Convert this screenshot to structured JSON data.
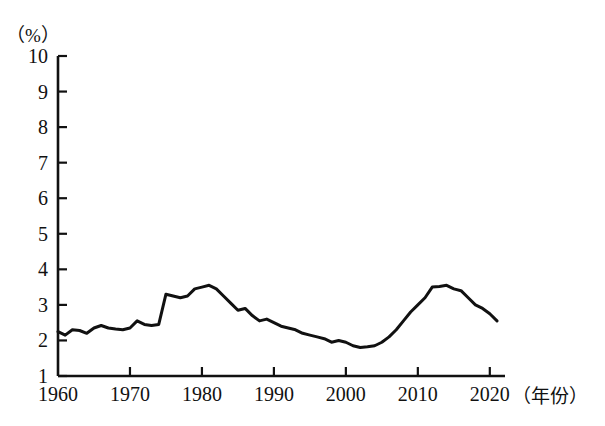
{
  "chart_data": {
    "type": "line",
    "title": "",
    "xlabel": "（年份）",
    "ylabel": "（%）",
    "xlim": [
      1960,
      2021
    ],
    "ylim": [
      1,
      10
    ],
    "grid": false,
    "legend": null,
    "y_ticks": [
      "10",
      "9",
      "8",
      "7",
      "6",
      "5",
      "4",
      "3",
      "2",
      "1"
    ],
    "y_tick_values": [
      10,
      9,
      8,
      7,
      6,
      5,
      4,
      3,
      2,
      1
    ],
    "x_ticks": [
      "1960",
      "1970",
      "1980",
      "1990",
      "2000",
      "2010",
      "2020"
    ],
    "x_tick_values": [
      1960,
      1970,
      1980,
      1990,
      2000,
      2010,
      2020
    ],
    "line_color": "#111111",
    "line_width": 3,
    "x": [
      1960,
      1961,
      1962,
      1963,
      1964,
      1965,
      1966,
      1967,
      1968,
      1969,
      1970,
      1971,
      1972,
      1973,
      1974,
      1975,
      1976,
      1977,
      1978,
      1979,
      1980,
      1981,
      1982,
      1983,
      1984,
      1985,
      1986,
      1987,
      1988,
      1989,
      1990,
      1991,
      1992,
      1993,
      1994,
      1995,
      1996,
      1997,
      1998,
      1999,
      2000,
      2001,
      2002,
      2003,
      2004,
      2005,
      2006,
      2007,
      2008,
      2009,
      2010,
      2011,
      2012,
      2013,
      2014,
      2015,
      2016,
      2017,
      2018,
      2019,
      2020,
      2021
    ],
    "values": [
      2.25,
      2.15,
      2.3,
      2.28,
      2.2,
      2.35,
      2.42,
      2.35,
      2.32,
      2.3,
      2.35,
      2.55,
      2.45,
      2.42,
      2.45,
      3.3,
      3.25,
      3.2,
      3.25,
      3.45,
      3.5,
      3.55,
      3.45,
      3.25,
      3.05,
      2.85,
      2.9,
      2.7,
      2.55,
      2.6,
      2.5,
      2.4,
      2.35,
      2.3,
      2.2,
      2.15,
      2.1,
      2.05,
      1.95,
      2.0,
      1.95,
      1.85,
      1.8,
      1.82,
      1.85,
      1.95,
      2.1,
      2.3,
      2.55,
      2.8,
      3.0,
      3.2,
      3.5,
      3.52,
      3.55,
      3.45,
      3.4,
      3.2,
      3.0,
      2.9,
      2.75,
      2.55
    ],
    "annotations": []
  },
  "axes": {
    "y_unit_label": "（%）",
    "x_unit_label": "（年份）"
  }
}
